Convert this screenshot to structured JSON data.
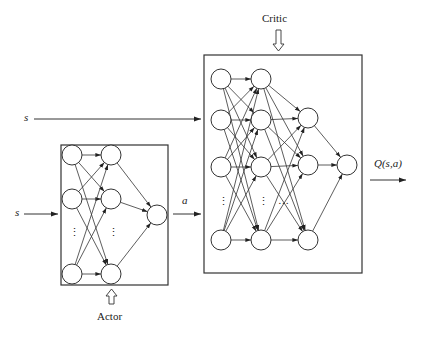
{
  "labels": {
    "critic": "Critic",
    "actor": "Actor",
    "state_top": "s",
    "state_actor": "s",
    "action": "a",
    "q_output": "Q(s,a)",
    "ellipsis": "⋮",
    "ellipsis_h": "…"
  },
  "colors": {
    "stroke": "#333333",
    "background": "#ffffff"
  },
  "actor_network": {
    "layers": [
      {
        "x": 72,
        "nodes_y": [
          155,
          199,
          274
        ]
      },
      {
        "x": 111,
        "nodes_y": [
          155,
          199,
          274
        ]
      },
      {
        "x": 157,
        "nodes_y": [
          215
        ]
      }
    ],
    "box": {
      "x": 61,
      "y": 145,
      "w": 107,
      "h": 140
    }
  },
  "critic_network": {
    "layers": [
      {
        "x": 221,
        "nodes_y": [
          79,
          120,
          167,
          240
        ]
      },
      {
        "x": 261,
        "nodes_y": [
          79,
          120,
          167,
          240
        ]
      },
      {
        "x": 308,
        "nodes_y": [
          118,
          165,
          240
        ]
      },
      {
        "x": 347,
        "nodes_y": [
          165
        ]
      }
    ],
    "box": {
      "x": 204,
      "y": 55,
      "w": 158,
      "h": 218
    }
  }
}
